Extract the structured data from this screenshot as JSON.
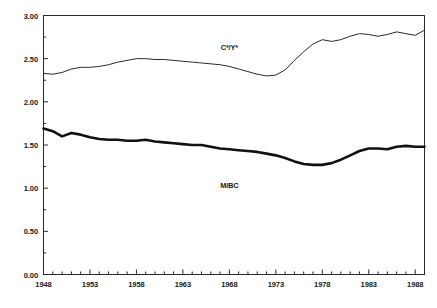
{
  "chart_data": {
    "type": "line",
    "title": "",
    "xlabel": "",
    "ylabel": "",
    "xlim": [
      1948,
      1989
    ],
    "ylim": [
      0.0,
      3.0
    ],
    "grid": false,
    "legend_position": "inline-annotation",
    "y_ticks": [
      "0.00",
      "0.50",
      "1.00",
      "1.50",
      "2.00",
      "2.50",
      "3.00"
    ],
    "y_tick_values": [
      0.0,
      0.5,
      1.0,
      1.5,
      2.0,
      2.5,
      3.0
    ],
    "x_ticks": [
      "1948",
      "1953",
      "1958",
      "1963",
      "1968",
      "1973",
      "1978",
      "1983",
      "1988"
    ],
    "x_tick_values": [
      1948,
      1953,
      1958,
      1963,
      1968,
      1973,
      1978,
      1983,
      1988
    ],
    "x_minor_tick_step": 1,
    "x": [
      1948,
      1949,
      1950,
      1951,
      1952,
      1953,
      1954,
      1955,
      1956,
      1957,
      1958,
      1959,
      1960,
      1961,
      1962,
      1963,
      1964,
      1965,
      1966,
      1967,
      1968,
      1969,
      1970,
      1971,
      1972,
      1973,
      1974,
      1975,
      1976,
      1977,
      1978,
      1979,
      1980,
      1981,
      1982,
      1983,
      1984,
      1985,
      1986,
      1987,
      1988,
      1989
    ],
    "series": [
      {
        "name": "C*/Y*",
        "label": "C*/Y*",
        "color": "#2b2b2b",
        "line_width": 1.0,
        "label_x": 1968,
        "label_y": 2.63,
        "values": [
          2.33,
          2.32,
          2.34,
          2.38,
          2.4,
          2.4,
          2.41,
          2.43,
          2.46,
          2.48,
          2.5,
          2.5,
          2.49,
          2.49,
          2.48,
          2.47,
          2.46,
          2.45,
          2.44,
          2.43,
          2.41,
          2.38,
          2.35,
          2.32,
          2.3,
          2.31,
          2.37,
          2.48,
          2.58,
          2.67,
          2.72,
          2.7,
          2.72,
          2.76,
          2.79,
          2.78,
          2.76,
          2.78,
          2.81,
          2.79,
          2.77,
          2.83
        ]
      },
      {
        "name": "M/BC",
        "label": "M/BC",
        "color": "#111111",
        "line_width": 2.6,
        "label_x": 1968,
        "label_y": 1.04,
        "values": [
          1.69,
          1.66,
          1.6,
          1.64,
          1.62,
          1.59,
          1.57,
          1.56,
          1.56,
          1.55,
          1.55,
          1.56,
          1.54,
          1.53,
          1.52,
          1.51,
          1.5,
          1.5,
          1.48,
          1.46,
          1.45,
          1.44,
          1.43,
          1.42,
          1.4,
          1.38,
          1.35,
          1.31,
          1.28,
          1.27,
          1.27,
          1.29,
          1.33,
          1.38,
          1.43,
          1.46,
          1.46,
          1.45,
          1.48,
          1.49,
          1.48,
          1.48
        ]
      }
    ]
  }
}
